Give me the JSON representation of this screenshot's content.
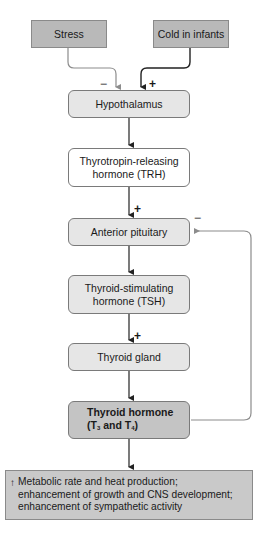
{
  "diagram": {
    "type": "flowchart",
    "topic": "Regulation of thyroid hormone secretion",
    "nodes": {
      "stress": "Stress",
      "cold": "Cold in infants",
      "hypothalamus": "Hypothalamus",
      "trh": "Thyrotropin-releasing hormone (TRH)",
      "anterior_pituitary": "Anterior pituitary",
      "tsh": "Thyroid-stimulating hormone (TSH)",
      "thyroid_gland": "Thyroid gland",
      "thyroid_hormone_line1": "Thyroid hormone",
      "thyroid_hormone_line2_prefix": "(T",
      "thyroid_hormone_sub1": "3",
      "thyroid_hormone_mid": " and T",
      "thyroid_hormone_sub2": "4",
      "thyroid_hormone_suffix": ")",
      "effects_arrow": "↑",
      "effects_line1": "Metabolic rate and heat production;",
      "effects_line2": "enhancement of growth and CNS development;",
      "effects_line3": "enhancement of sympathetic activity"
    },
    "signs": {
      "stress_to_hypothalamus": "−",
      "cold_to_hypothalamus": "+",
      "trh_to_pituitary": "+",
      "tsh_to_thyroid": "+",
      "feedback_to_pituitary": "−"
    },
    "edges": [
      {
        "from": "Stress",
        "to": "Hypothalamus",
        "sign": "−"
      },
      {
        "from": "Cold in infants",
        "to": "Hypothalamus",
        "sign": "+"
      },
      {
        "from": "Hypothalamus",
        "to": "TRH"
      },
      {
        "from": "TRH",
        "to": "Anterior pituitary",
        "sign": "+"
      },
      {
        "from": "Anterior pituitary",
        "to": "TSH"
      },
      {
        "from": "TSH",
        "to": "Thyroid gland",
        "sign": "+"
      },
      {
        "from": "Thyroid gland",
        "to": "Thyroid hormone"
      },
      {
        "from": "Thyroid hormone",
        "to": "Anterior pituitary",
        "sign": "−",
        "kind": "negative feedback"
      },
      {
        "from": "Thyroid hormone",
        "to": "Effects"
      }
    ],
    "colors": {
      "source_box": "#b9b9b9",
      "light_box": "#e6e6e6",
      "hormone_box": "#c4c4c4",
      "effects_box": "#c9c9c9",
      "gray_line": "#8c8c8c",
      "dark_line": "#222222"
    }
  }
}
